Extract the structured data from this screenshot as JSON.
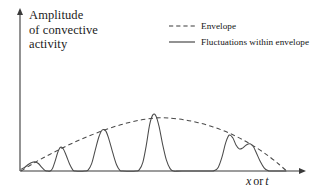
{
  "figure": {
    "background": "#ffffff",
    "ink_color": "#3a3a3a",
    "width": 316,
    "height": 194
  },
  "axes": {
    "y_label": "Amplitude\nof convective\nactivity",
    "x_label_var1": "x",
    "x_label_conjunction": "or",
    "x_label_var2": "t",
    "origin_x": 20,
    "baseline_y": 171,
    "x_axis_end": 306,
    "y_axis_top": 9
  },
  "legend": {
    "items": [
      {
        "label": "Envelope",
        "style": "dashed"
      },
      {
        "label": "Fluctuations within envelope",
        "style": "solid"
      }
    ]
  },
  "chart_data": {
    "type": "line",
    "title": "",
    "xlabel": "x or t",
    "ylabel": "Amplitude of convective activity",
    "xlim": [
      0,
      1
    ],
    "ylim": [
      0,
      1
    ],
    "grid": false,
    "legend_position": "top-right",
    "axis_ticks": {
      "x": [],
      "y": []
    },
    "series": [
      {
        "name": "Envelope",
        "style": "dashed",
        "comment": "Smooth arch from origin, peaking near x=0.52, decaying to baseline near x=0.98",
        "points": [
          [
            0.004,
            0.0
          ],
          [
            0.055,
            0.108
          ],
          [
            0.11,
            0.21
          ],
          [
            0.165,
            0.305
          ],
          [
            0.22,
            0.392
          ],
          [
            0.275,
            0.47
          ],
          [
            0.33,
            0.539
          ],
          [
            0.385,
            0.597
          ],
          [
            0.44,
            0.642
          ],
          [
            0.495,
            0.669
          ],
          [
            0.52,
            0.674
          ],
          [
            0.55,
            0.671
          ],
          [
            0.605,
            0.65
          ],
          [
            0.66,
            0.612
          ],
          [
            0.715,
            0.558
          ],
          [
            0.77,
            0.487
          ],
          [
            0.825,
            0.396
          ],
          [
            0.88,
            0.285
          ],
          [
            0.925,
            0.178
          ],
          [
            0.96,
            0.082
          ],
          [
            0.985,
            0.008
          ]
        ]
      },
      {
        "name": "Fluctuations within envelope",
        "style": "solid",
        "comment": "Series of narrow peaks whose maxima ride just at or under the envelope",
        "peaks": [
          {
            "center": 0.055,
            "height": 0.115,
            "width": 0.05
          },
          {
            "center": 0.15,
            "height": 0.3,
            "width": 0.055
          },
          {
            "center": 0.305,
            "height": 0.52,
            "width": 0.058
          },
          {
            "center": 0.49,
            "height": 0.71,
            "width": 0.055
          },
          {
            "center": 0.775,
            "height": 0.455,
            "width": 0.052
          },
          {
            "center": 0.855,
            "height": 0.345,
            "width": 0.048
          }
        ],
        "points": [
          [
            0.004,
            0.022
          ],
          [
            0.018,
            0.048
          ],
          [
            0.032,
            0.085
          ],
          [
            0.046,
            0.11
          ],
          [
            0.056,
            0.115
          ],
          [
            0.068,
            0.095
          ],
          [
            0.08,
            0.048
          ],
          [
            0.092,
            0.008
          ],
          [
            0.1,
            0.0
          ],
          [
            0.112,
            0.0
          ],
          [
            0.12,
            0.03
          ],
          [
            0.13,
            0.125
          ],
          [
            0.14,
            0.238
          ],
          [
            0.15,
            0.3
          ],
          [
            0.16,
            0.282
          ],
          [
            0.172,
            0.19
          ],
          [
            0.184,
            0.085
          ],
          [
            0.196,
            0.012
          ],
          [
            0.205,
            0.0
          ],
          [
            0.24,
            0.0
          ],
          [
            0.252,
            0.012
          ],
          [
            0.265,
            0.09
          ],
          [
            0.278,
            0.255
          ],
          [
            0.292,
            0.43
          ],
          [
            0.305,
            0.52
          ],
          [
            0.318,
            0.505
          ],
          [
            0.33,
            0.395
          ],
          [
            0.344,
            0.225
          ],
          [
            0.358,
            0.075
          ],
          [
            0.37,
            0.008
          ],
          [
            0.38,
            0.0
          ],
          [
            0.43,
            0.0
          ],
          [
            0.442,
            0.018
          ],
          [
            0.455,
            0.11
          ],
          [
            0.468,
            0.33
          ],
          [
            0.48,
            0.585
          ],
          [
            0.492,
            0.71
          ],
          [
            0.503,
            0.7
          ],
          [
            0.515,
            0.565
          ],
          [
            0.528,
            0.34
          ],
          [
            0.542,
            0.14
          ],
          [
            0.556,
            0.03
          ],
          [
            0.568,
            0.0
          ],
          [
            0.6,
            0.0
          ],
          [
            0.7,
            0.0
          ],
          [
            0.72,
            0.005
          ],
          [
            0.734,
            0.045
          ],
          [
            0.748,
            0.175
          ],
          [
            0.762,
            0.36
          ],
          [
            0.775,
            0.455
          ],
          [
            0.788,
            0.42
          ],
          [
            0.8,
            0.33
          ],
          [
            0.812,
            0.28
          ],
          [
            0.824,
            0.29
          ],
          [
            0.838,
            0.33
          ],
          [
            0.852,
            0.345
          ],
          [
            0.864,
            0.31
          ],
          [
            0.876,
            0.225
          ],
          [
            0.89,
            0.12
          ],
          [
            0.904,
            0.04
          ],
          [
            0.918,
            0.005
          ],
          [
            0.93,
            0.0
          ],
          [
            0.985,
            0.0
          ]
        ]
      }
    ]
  }
}
